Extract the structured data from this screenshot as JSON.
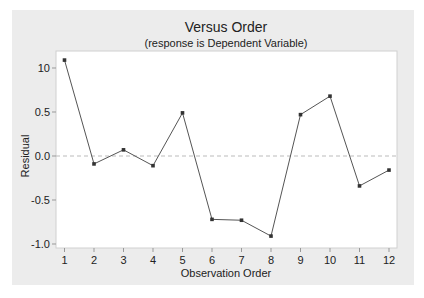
{
  "chart_data": {
    "type": "line",
    "title": "Versus Order",
    "subtitle": "(response is Dependent Variable)",
    "xlabel": "Observation Order",
    "ylabel": "Residual",
    "x": [
      1,
      2,
      3,
      4,
      5,
      6,
      7,
      8,
      9,
      10,
      11,
      12
    ],
    "series": [
      {
        "name": "Residual",
        "values": [
          1.09,
          -0.09,
          0.07,
          -0.11,
          0.49,
          -0.72,
          -0.73,
          -0.91,
          0.47,
          0.68,
          -0.34,
          -0.16
        ]
      }
    ],
    "x_ticks": [
      "1",
      "2",
      "3",
      "4",
      "5",
      "6",
      "7",
      "8",
      "9",
      "10",
      "11",
      "12"
    ],
    "y_ticks": [
      {
        "value": 1.0,
        "label": "10"
      },
      {
        "value": 0.5,
        "label": "0.5"
      },
      {
        "value": 0.0,
        "label": "0.0"
      },
      {
        "value": -0.5,
        "label": "-0.5"
      },
      {
        "value": -1.0,
        "label": "-1.0"
      }
    ],
    "ylim": [
      -1.05,
      1.19
    ],
    "reference_line": {
      "y": 0,
      "style": "dashed"
    },
    "grid": false,
    "legend": "none"
  },
  "colors": {
    "panel": "#ececec",
    "plot_bg": "#ffffff",
    "line": "#555555",
    "marker": "#333333",
    "reference": "#bbbbbb",
    "text": "#222222"
  }
}
